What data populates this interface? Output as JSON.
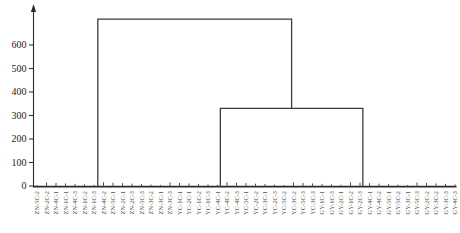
{
  "chart_data": {
    "type": "dendrogram",
    "title": "",
    "xlabel": "",
    "ylabel": "",
    "y_axis": {
      "ticks": [
        0,
        100,
        200,
        300,
        400,
        500,
        600
      ],
      "lim": [
        0,
        750
      ],
      "grid": false
    },
    "leaves": [
      "ZN-5C-2",
      "ZN-2C-2",
      "ZN-4C-1",
      "ZN-1C-1",
      "ZN-4C-3",
      "ZN-1C-2",
      "ZN-1C-3",
      "ZN-4C-2",
      "ZN-5C-1",
      "ZN-2C-1",
      "ZN-2C-3",
      "ZN-5C-3",
      "ZN-3C-2",
      "ZN-3C-1",
      "ZN-3C-3",
      "YC-1C-1",
      "YC-2C-1",
      "YC-1C-2",
      "YC-1C-3",
      "YC-4C-1",
      "YC-4C-2",
      "YC-4C-3",
      "YC-5C-1",
      "YC-2C-2",
      "YC-3C-1",
      "YC-2C-3",
      "YC-5C-2",
      "YC-3C-2",
      "YC-5C-3",
      "YC-3C-3",
      "GY-1C-1",
      "GY-1C-3",
      "GY-2C-1",
      "GY-1C-2",
      "GY-2C-3",
      "GY-4C-1",
      "GY-4C-2",
      "GY-5C-1",
      "GY-5C-2",
      "GY-3C-1",
      "GY-5C-3",
      "GY-2C-2",
      "GY-3C-2",
      "GY-3C-3",
      "GY-4C-3"
    ],
    "groups": [
      {
        "name": "ZN",
        "leaf_start": 0,
        "leaf_end": 14,
        "stem_leaf_pos": 6.4
      },
      {
        "name": "YC",
        "leaf_start": 15,
        "leaf_end": 29,
        "stem_leaf_pos": 19.3
      },
      {
        "name": "GY",
        "leaf_start": 30,
        "leaf_end": 44,
        "stem_leaf_pos": 34.3
      }
    ],
    "linkage": [
      {
        "join": [
          "YC",
          "GY"
        ],
        "height": 330
      },
      {
        "join": [
          "ZN",
          "YC+GY"
        ],
        "height": 710
      }
    ],
    "leaf_merge_max_height": 20,
    "legend": null,
    "colors": {
      "line": "#3c3c3c",
      "axis": "#2b2b2b",
      "tick_text": "#222222",
      "leaf_text": "#4d4d4d",
      "background": "#ffffff"
    }
  }
}
